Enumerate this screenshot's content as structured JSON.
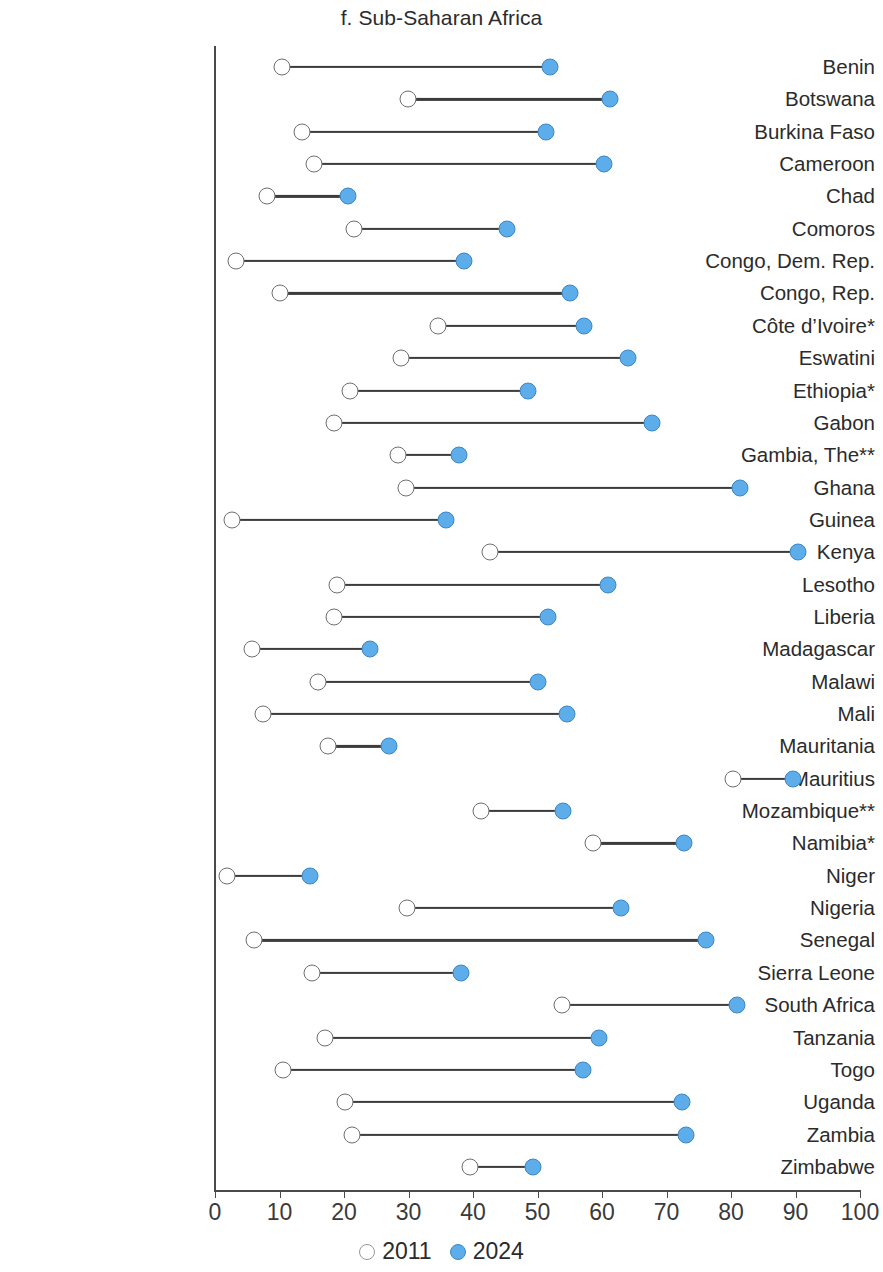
{
  "title": "f. Sub-Saharan Africa",
  "axis": {
    "ticks": [
      0,
      10,
      20,
      30,
      40,
      50,
      60,
      70,
      80,
      90,
      100
    ],
    "tick_labels": [
      "0",
      "10",
      "20",
      "30",
      "40",
      "50",
      "60",
      "70",
      "80",
      "90",
      "100"
    ],
    "min": 0,
    "max": 100
  },
  "legend": {
    "items": [
      {
        "label": "2011",
        "color": "#ffffff",
        "style": "open"
      },
      {
        "label": "2024",
        "color": "#5cade9",
        "style": "filled"
      }
    ]
  },
  "colors": {
    "series_2011": "#ffffff",
    "series_2011_stroke": "#6e6e6e",
    "series_2024": "#5cade9",
    "series_2024_stroke": "#3f86c4",
    "connector": "#3c3c3c",
    "axis": "#4a4a4a",
    "text": "#2b2b2b"
  },
  "chart_data": {
    "type": "dumbbell",
    "title": "f. Sub-Saharan Africa",
    "xlabel": "",
    "ylabel": "",
    "xlim": [
      0,
      100
    ],
    "grid": false,
    "legend_position": "bottom-center",
    "categories": [
      "Benin",
      "Botswana",
      "Burkina Faso",
      "Cameroon",
      "Chad",
      "Comoros",
      "Congo, Dem. Rep.",
      "Congo, Rep.",
      "Côte d’Ivoire*",
      "Eswatini",
      "Ethiopia*",
      "Gabon",
      "Gambia, The**",
      "Ghana",
      "Guinea",
      "Kenya",
      "Lesotho",
      "Liberia",
      "Madagascar",
      "Malawi",
      "Mali",
      "Mauritania",
      "Mauritius",
      "Mozambique**",
      "Namibia*",
      "Niger",
      "Nigeria",
      "Senegal",
      "Sierra Leone",
      "South Africa",
      "Tanzania",
      "Togo",
      "Uganda",
      "Zambia",
      "Zimbabwe"
    ],
    "series": [
      {
        "name": "2011",
        "values": [
          10.4,
          29.9,
          13.5,
          15.3,
          8.0,
          21.5,
          3.3,
          10.0,
          34.5,
          28.9,
          21.0,
          18.5,
          28.3,
          29.6,
          2.7,
          42.6,
          18.9,
          18.5,
          5.7,
          15.9,
          7.4,
          17.5,
          80.3,
          41.2,
          58.6,
          1.8,
          29.8,
          6.0,
          15.0,
          53.8,
          17.0,
          10.5,
          20.2,
          21.2,
          39.5
        ]
      },
      {
        "name": "2024",
        "values": [
          52.0,
          61.3,
          51.3,
          60.3,
          20.6,
          45.3,
          38.6,
          55.0,
          57.2,
          64.0,
          48.5,
          67.8,
          37.9,
          81.4,
          35.8,
          90.4,
          61.0,
          51.6,
          24.0,
          50.0,
          54.5,
          27.0,
          89.6,
          54.0,
          72.7,
          14.7,
          63.0,
          76.2,
          38.2,
          81.0,
          59.6,
          57.0,
          72.4,
          73.0,
          49.3
        ]
      }
    ],
    "rows": [
      {
        "label": "Benin",
        "v2011": 10.4,
        "v2024": 52.0
      },
      {
        "label": "Botswana",
        "v2011": 29.9,
        "v2024": 61.3
      },
      {
        "label": "Burkina Faso",
        "v2011": 13.5,
        "v2024": 51.3
      },
      {
        "label": "Cameroon",
        "v2011": 15.3,
        "v2024": 60.3
      },
      {
        "label": "Chad",
        "v2011": 8.0,
        "v2024": 20.6
      },
      {
        "label": "Comoros",
        "v2011": 21.5,
        "v2024": 45.3
      },
      {
        "label": "Congo, Dem. Rep.",
        "v2011": 3.3,
        "v2024": 38.6
      },
      {
        "label": "Congo, Rep.",
        "v2011": 10.0,
        "v2024": 55.0
      },
      {
        "label": "Côte d’Ivoire*",
        "v2011": 34.5,
        "v2024": 57.2
      },
      {
        "label": "Eswatini",
        "v2011": 28.9,
        "v2024": 64.0
      },
      {
        "label": "Ethiopia*",
        "v2011": 21.0,
        "v2024": 48.5
      },
      {
        "label": "Gabon",
        "v2011": 18.5,
        "v2024": 67.8
      },
      {
        "label": "Gambia, The**",
        "v2011": 28.3,
        "v2024": 37.9
      },
      {
        "label": "Ghana",
        "v2011": 29.6,
        "v2024": 81.4
      },
      {
        "label": "Guinea",
        "v2011": 2.7,
        "v2024": 35.8
      },
      {
        "label": "Kenya",
        "v2011": 42.6,
        "v2024": 90.4
      },
      {
        "label": "Lesotho",
        "v2011": 18.9,
        "v2024": 61.0
      },
      {
        "label": "Liberia",
        "v2011": 18.5,
        "v2024": 51.6
      },
      {
        "label": "Madagascar",
        "v2011": 5.7,
        "v2024": 24.0
      },
      {
        "label": "Malawi",
        "v2011": 15.9,
        "v2024": 50.0
      },
      {
        "label": "Mali",
        "v2011": 7.4,
        "v2024": 54.5
      },
      {
        "label": "Mauritania",
        "v2011": 17.5,
        "v2024": 27.0
      },
      {
        "label": "Mauritius",
        "v2011": 80.3,
        "v2024": 89.6
      },
      {
        "label": "Mozambique**",
        "v2011": 41.2,
        "v2024": 54.0
      },
      {
        "label": "Namibia*",
        "v2011": 58.6,
        "v2024": 72.7
      },
      {
        "label": "Niger",
        "v2011": 1.8,
        "v2024": 14.7
      },
      {
        "label": "Nigeria",
        "v2011": 29.8,
        "v2024": 63.0
      },
      {
        "label": "Senegal",
        "v2011": 6.0,
        "v2024": 76.2
      },
      {
        "label": "Sierra Leone",
        "v2011": 15.0,
        "v2024": 38.2
      },
      {
        "label": "South Africa",
        "v2011": 53.8,
        "v2024": 81.0
      },
      {
        "label": "Tanzania",
        "v2011": 17.0,
        "v2024": 59.6
      },
      {
        "label": "Togo",
        "v2011": 10.5,
        "v2024": 57.0
      },
      {
        "label": "Uganda",
        "v2011": 20.2,
        "v2024": 72.4
      },
      {
        "label": "Zambia",
        "v2011": 21.2,
        "v2024": 73.0
      },
      {
        "label": "Zimbabwe",
        "v2011": 39.5,
        "v2024": 49.3
      }
    ]
  }
}
